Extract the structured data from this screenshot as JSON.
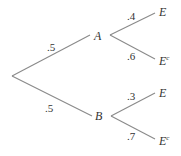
{
  "diagram": {
    "type": "probability-tree",
    "nodes": {
      "A": "A",
      "B": "B",
      "A_E": "E",
      "A_Ec": "E",
      "B_E": "E",
      "B_Ec": "E",
      "complement_mark": "c"
    },
    "edges": {
      "root_A": ".5",
      "root_B": ".5",
      "A_E": ".4",
      "A_Ec": ".6",
      "B_E": ".3",
      "B_Ec": ".7"
    },
    "colors": {
      "line": "#8a8a8a",
      "text": "#333333",
      "background": "#ffffff"
    }
  }
}
